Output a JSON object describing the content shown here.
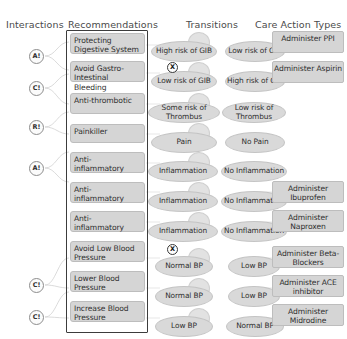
{
  "headers": {
    "interactions": "Interactions",
    "recommendations": "Recommendations",
    "transitions": "Transitions",
    "care_action_types": "Care Action Types"
  },
  "interactions": {
    "badges": [
      {
        "label": "A!",
        "meaning": "alert-interaction-badge"
      },
      {
        "label": "C!",
        "meaning": "contraindication-interaction-badge"
      },
      {
        "label": "R!",
        "meaning": "repetition-interaction-badge"
      },
      {
        "label": "A!",
        "meaning": "alert-interaction-badge"
      },
      {
        "label": "C!",
        "meaning": "contraindication-interaction-badge"
      },
      {
        "label": "C!",
        "meaning": "contraindication-interaction-badge"
      }
    ]
  },
  "recommendations": {
    "items": [
      {
        "label": "Protecting Digestive System"
      },
      {
        "label": "Avoid Gastro-Intestinal Bleeding"
      },
      {
        "label": "Anti-thrombotic"
      },
      {
        "label": "Painkiller"
      },
      {
        "label": "Anti-inflammatory"
      },
      {
        "label": "Anti-inflammatory"
      },
      {
        "label": "Anti-inflammatory"
      },
      {
        "label": "Avoid Low Blood Pressure"
      },
      {
        "label": "Lower Blood Pressure"
      },
      {
        "label": "Increase Blood Pressure"
      }
    ]
  },
  "transitions": {
    "rows": [
      {
        "from": "High risk of GIB",
        "to": "Low risk of GIB",
        "conflict": false
      },
      {
        "from": "Low risk of GIB",
        "to": "High risk of GIB",
        "conflict": true,
        "conflict_label": "X"
      },
      {
        "from": "Some risk of Thrombus",
        "to": "Low risk of Thrombus",
        "conflict": false
      },
      {
        "from": "Pain",
        "to": "No Pain",
        "conflict": false
      },
      {
        "from": "Inflammation",
        "to": "No Inflammation",
        "conflict": false
      },
      {
        "from": "Inflammation",
        "to": "No Inflammation",
        "conflict": false
      },
      {
        "from": "Inflammation",
        "to": "No Inflammation",
        "conflict": false
      },
      {
        "from": "Normal BP",
        "to": "Low BP",
        "conflict": true,
        "conflict_label": "X"
      },
      {
        "from": "Normal BP",
        "to": "Low BP",
        "conflict": false
      },
      {
        "from": "Low BP",
        "to": "Normal BP",
        "conflict": false
      }
    ]
  },
  "care_action_types": {
    "items": [
      {
        "label": "Administer PPI"
      },
      {
        "label": "Administer Aspirin"
      },
      {
        "label": "Administer Ibuprofen"
      },
      {
        "label": "Administer Naproxen"
      },
      {
        "label": "Administer Beta-Blockers"
      },
      {
        "label": "Administer ACE inhibitor"
      },
      {
        "label": "Administer Midrodine"
      }
    ]
  },
  "colors": {
    "node_fill": "#d5d5d5",
    "panel_border": "#3c3c3c",
    "connector": "#cfcfcf",
    "text": "#2f2f2f",
    "background": "#ffffff"
  }
}
